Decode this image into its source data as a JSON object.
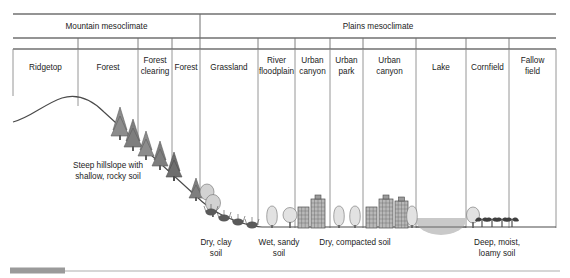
{
  "figure": {
    "mesoclimates": [
      {
        "label": "Mountain mesoclimate",
        "x0": 13,
        "x1": 200
      },
      {
        "label": "Plains mesoclimate",
        "x0": 200,
        "x1": 556
      }
    ],
    "zones": [
      {
        "label": "Ridgetop",
        "x0": 13,
        "x1": 78,
        "lines": [
          "Ridgetop"
        ]
      },
      {
        "label": "Forest",
        "x0": 78,
        "x1": 138,
        "lines": [
          "Forest"
        ]
      },
      {
        "label": "Forest clearing",
        "x0": 138,
        "x1": 172,
        "lines": [
          "Forest",
          "clearing"
        ]
      },
      {
        "label": "Forest",
        "x0": 172,
        "x1": 200,
        "lines": [
          "Forest"
        ]
      },
      {
        "label": "Grassland",
        "x0": 200,
        "x1": 258,
        "lines": [
          "Grassland"
        ]
      },
      {
        "label": "River floodplain",
        "x0": 258,
        "x1": 295,
        "lines": [
          "River",
          "floodplain"
        ]
      },
      {
        "label": "Urban canyon",
        "x0": 295,
        "x1": 330,
        "lines": [
          "Urban",
          "canyon"
        ]
      },
      {
        "label": "Urban park",
        "x0": 330,
        "x1": 363,
        "lines": [
          "Urban",
          "park"
        ]
      },
      {
        "label": "Urban canyon",
        "x0": 363,
        "x1": 416,
        "lines": [
          "Urban",
          "canyon"
        ]
      },
      {
        "label": "Lake",
        "x0": 416,
        "x1": 466,
        "lines": [
          "Lake"
        ]
      },
      {
        "label": "Cornfield",
        "x0": 466,
        "x1": 509,
        "lines": [
          "Cornfield"
        ]
      },
      {
        "label": "Fallow field",
        "x0": 509,
        "x1": 556,
        "lines": [
          "Fallow",
          "field"
        ]
      }
    ],
    "annotations": [
      {
        "name": "hillslope-note",
        "lines": [
          "Steep hillslope with",
          "shallow, rocky soil"
        ],
        "x": 108,
        "y": 170
      }
    ],
    "soil_labels": [
      {
        "name": "dry-clay-soil",
        "lines": [
          "Dry, clay",
          "soil"
        ],
        "x": 216,
        "y": 247
      },
      {
        "name": "wet-sandy-soil",
        "lines": [
          "Wet, sandy",
          "soil"
        ],
        "x": 277,
        "y": 247
      },
      {
        "name": "dry-compacted-soil",
        "lines": [
          "Dry, compacted soil"
        ],
        "x": 352,
        "y": 247
      },
      {
        "name": "deep-moist-loamy-soil",
        "lines": [
          "Deep, moist,",
          "loamy soil"
        ],
        "x": 496,
        "y": 247
      }
    ],
    "colors": {
      "rule": "#2b2b2b",
      "divider": "#8a8a8a",
      "ground": "#4a4a4a",
      "conifer": "#8c8c8c",
      "conifer_dark": "#6e6e6e",
      "deciduous": "#d2d2d2",
      "building": "#b8b8b8",
      "building_dark": "#7a7a7a",
      "water": "#c9c9c9",
      "shrub": "#5a5a5a",
      "corn": "#3f3f3f",
      "footer_bar": "#9a9a9a",
      "footer_rule": "#c9c9c9",
      "text": "#1b1b1b"
    },
    "footer": {
      "bar_x0": 10,
      "bar_x1": 65,
      "bar_y": 268,
      "rule_y": 271
    }
  }
}
